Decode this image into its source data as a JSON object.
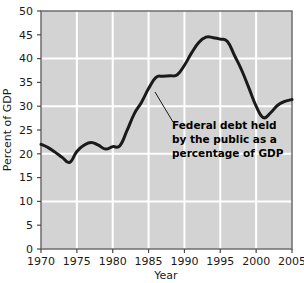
{
  "chart_data": {
    "type": "line",
    "title": "",
    "xlabel": "Year",
    "ylabel": "Percent of GDP",
    "xlim": [
      1970,
      2005
    ],
    "ylim": [
      0,
      50
    ],
    "grid": true,
    "legend": "none",
    "x_ticks": [
      "1970",
      "1975",
      "1980",
      "1985",
      "1990",
      "1995",
      "2000",
      "2005"
    ],
    "x_tick_values": [
      1970,
      1975,
      1980,
      1985,
      1990,
      1995,
      2000,
      2005
    ],
    "y_ticks": [
      "0",
      "5",
      "10",
      "15",
      "20",
      "25",
      "30",
      "35",
      "40",
      "45",
      "50"
    ],
    "y_tick_values": [
      0,
      5,
      10,
      15,
      20,
      25,
      30,
      35,
      40,
      45,
      50
    ],
    "gridlines_y": [
      10,
      20,
      30,
      40
    ],
    "gridlines_x": [
      1975,
      1980,
      1985,
      1990,
      1995,
      2000
    ],
    "series": [
      {
        "name": "Federal debt held by the public as a percentage of GDP",
        "color": "#1a1a1a",
        "x": [
          1970,
          1971,
          1972,
          1973,
          1974,
          1975,
          1976,
          1977,
          1978,
          1979,
          1980,
          1981,
          1982,
          1983,
          1984,
          1985,
          1986,
          1987,
          1988,
          1989,
          1990,
          1991,
          1992,
          1993,
          1994,
          1995,
          1996,
          1997,
          1998,
          1999,
          2000,
          2001,
          2002,
          2003,
          2004,
          2005
        ],
        "values": [
          22.0,
          21.3,
          20.3,
          19.2,
          18.2,
          20.5,
          21.8,
          22.4,
          21.8,
          21.0,
          21.5,
          21.7,
          24.9,
          28.4,
          30.8,
          33.7,
          36.0,
          36.3,
          36.4,
          36.6,
          38.6,
          41.2,
          43.4,
          44.5,
          44.4,
          44.1,
          43.6,
          40.6,
          37.5,
          33.8,
          30.0,
          27.6,
          28.6,
          30.2,
          31.0,
          31.4
        ]
      }
    ],
    "annotations": [
      {
        "name": "series-annotation",
        "lines": [
          "Federal debt held",
          "by the public as a",
          "percentage of GDP"
        ],
        "text": "Federal debt held by the public as a percentage of GDP",
        "leader_from": {
          "x": 155,
          "y": 92
        },
        "leader_to": {
          "x": 173,
          "y": 122
        }
      }
    ],
    "colors": {
      "plot_background": "#d3d3d3",
      "gridline": "#ffffff",
      "line": "#1a1a1a",
      "axis": "#4a4a4a",
      "text": "#1a1a1a",
      "page_background": "#ffffff"
    }
  }
}
